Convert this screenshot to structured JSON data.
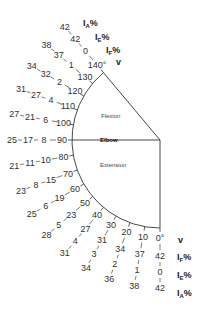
{
  "diagram": {
    "center_label": "Elbow",
    "regions": {
      "flexion": "Flexion",
      "extension": "Extension"
    },
    "column_headers": {
      "angle": "V",
      "flexion_impairment": "IF%",
      "extension_impairment": "IE%",
      "ankylosis_impairment": "IA%"
    },
    "headers_top": [
      {
        "main": "I",
        "sub": "A",
        "tail": "%"
      },
      {
        "main": "I",
        "sub": "E",
        "tail": "%"
      },
      {
        "main": "I",
        "sub": "F",
        "tail": "%"
      },
      {
        "main": "v",
        "sub": "",
        "tail": ""
      }
    ],
    "headers_bottom": [
      {
        "main": "v",
        "sub": "",
        "tail": ""
      },
      {
        "main": "I",
        "sub": "F",
        "tail": "%"
      },
      {
        "main": "I",
        "sub": "E",
        "tail": "%"
      },
      {
        "main": "I",
        "sub": "A",
        "tail": "%"
      }
    ],
    "rows": [
      {
        "angle": "140°",
        "IF": "0",
        "IE": "42",
        "IA": "42"
      },
      {
        "angle": "130",
        "IF": "1",
        "IE": "37",
        "IA": "38"
      },
      {
        "angle": "120",
        "IF": "2",
        "IE": "32",
        "IA": "34"
      },
      {
        "angle": "110",
        "IF": "4",
        "IE": "27",
        "IA": "31"
      },
      {
        "angle": "100",
        "IF": "6",
        "IE": "21",
        "IA": "27"
      },
      {
        "angle": "90",
        "IF": "8",
        "IE": "17",
        "IA": "25"
      },
      {
        "angle": "80",
        "IF": "10",
        "IE": "11",
        "IA": "21"
      },
      {
        "angle": "70",
        "IF": "15",
        "IE": "8",
        "IA": "23"
      },
      {
        "angle": "60",
        "IF": "19",
        "IE": "6",
        "IA": "25"
      },
      {
        "angle": "50",
        "IF": "23",
        "IE": "5",
        "IA": "28"
      },
      {
        "angle": "40",
        "IF": "27",
        "IE": "4",
        "IA": "31"
      },
      {
        "angle": "30",
        "IF": "31",
        "IE": "3",
        "IA": "34"
      },
      {
        "angle": "20",
        "IF": "34",
        "IE": "2",
        "IA": "36"
      },
      {
        "angle": "10",
        "IF": "37",
        "IE": "1",
        "IA": "38"
      },
      {
        "angle": "0°",
        "IF": "42",
        "IE": "0",
        "IA": "42"
      }
    ]
  }
}
